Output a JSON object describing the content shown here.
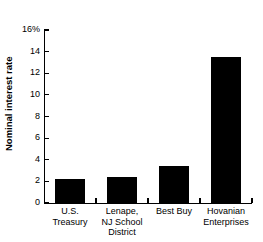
{
  "chart_data": {
    "type": "bar",
    "title": "",
    "subtitle": "",
    "xlabel": "",
    "ylabel": "Nominal interest rate",
    "categories": [
      "U.S.\nTreasury",
      "Lenape,\nNJ School\nDistrict",
      "Best Buy",
      "Hovanian\nEnterprises"
    ],
    "values": [
      2.2,
      2.4,
      3.4,
      13.5
    ],
    "ylim": [
      0,
      16
    ],
    "ytick_values": [
      0,
      2,
      4,
      6,
      8,
      10,
      12,
      14,
      16
    ],
    "ytick_labels": [
      "0",
      "2",
      "4",
      "6",
      "8",
      "10",
      "12",
      "14",
      "16%"
    ],
    "grid": false,
    "legend": false,
    "legend_position": "none",
    "bar_color": "#000000",
    "axis_color": "#000000",
    "background_color": "#ffffff"
  },
  "axes": {
    "y_title": "Nominal interest rate"
  }
}
